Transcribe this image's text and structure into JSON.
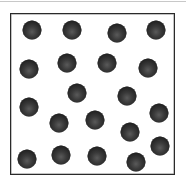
{
  "diagram": {
    "container": {
      "left": 10,
      "top": 13,
      "right": 176,
      "bottom": 176,
      "border_color": "#2a2a2a"
    },
    "particle_style": {
      "diameter": 19,
      "color": "#2a2a2a"
    },
    "particle_count": 20,
    "particles": [
      {
        "x": 32,
        "y": 30
      },
      {
        "x": 72,
        "y": 30
      },
      {
        "x": 117,
        "y": 33
      },
      {
        "x": 156,
        "y": 30
      },
      {
        "x": 29,
        "y": 69
      },
      {
        "x": 67,
        "y": 63
      },
      {
        "x": 107,
        "y": 63
      },
      {
        "x": 148,
        "y": 68
      },
      {
        "x": 77,
        "y": 93
      },
      {
        "x": 127,
        "y": 96
      },
      {
        "x": 29,
        "y": 107
      },
      {
        "x": 59,
        "y": 123
      },
      {
        "x": 95,
        "y": 120
      },
      {
        "x": 159,
        "y": 113
      },
      {
        "x": 130,
        "y": 132
      },
      {
        "x": 160,
        "y": 146
      },
      {
        "x": 27,
        "y": 159
      },
      {
        "x": 61,
        "y": 155
      },
      {
        "x": 97,
        "y": 156
      },
      {
        "x": 136,
        "y": 162
      }
    ]
  }
}
